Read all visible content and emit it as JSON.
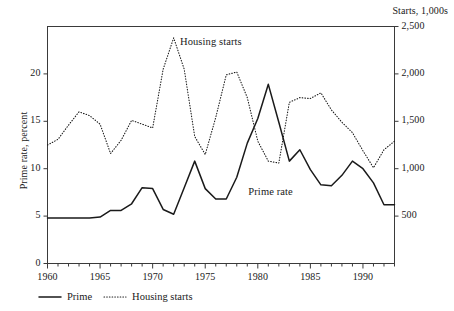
{
  "chart_data": {
    "type": "line",
    "title": "",
    "subtitle": "",
    "xlabel": "",
    "ylabel": "Prime rate, percent",
    "y2label": "Starts, 1,000s",
    "xlim": [
      1960,
      1993
    ],
    "ylim": [
      0,
      25
    ],
    "y2lim": [
      0,
      2500
    ],
    "grid": false,
    "legend_position": "below-axis-left",
    "x_tick_labels": [
      "1960",
      "1965",
      "1970",
      "1975",
      "1980",
      "1985",
      "1990"
    ],
    "x_tick_values": [
      1960,
      1965,
      1970,
      1975,
      1980,
      1985,
      1990
    ],
    "x_minor_tick_step": 1,
    "y_tick_labels": [
      "0",
      "5",
      "10",
      "15",
      "20"
    ],
    "y_tick_values": [
      0,
      5,
      10,
      15,
      20
    ],
    "y2_tick_labels": [
      "500",
      "1,000",
      "1,500",
      "2,000",
      "2,500"
    ],
    "y2_tick_values": [
      500,
      1000,
      1500,
      2000,
      2500
    ],
    "x": [
      1960,
      1961,
      1962,
      1963,
      1964,
      1965,
      1966,
      1967,
      1968,
      1969,
      1970,
      1971,
      1972,
      1973,
      1974,
      1975,
      1976,
      1977,
      1978,
      1979,
      1980,
      1981,
      1982,
      1983,
      1984,
      1985,
      1986,
      1987,
      1988,
      1989,
      1990,
      1991,
      1992,
      1993
    ],
    "series": [
      {
        "name": "Prime",
        "axis": "left",
        "style": "solid",
        "color": "#1a1a1a",
        "annotation": "Prime rate",
        "values": [
          4.8,
          4.8,
          4.8,
          4.8,
          4.8,
          4.9,
          5.6,
          5.6,
          6.3,
          8.0,
          7.9,
          5.7,
          5.2,
          8.0,
          10.8,
          7.9,
          6.8,
          6.8,
          9.1,
          12.7,
          15.3,
          18.9,
          14.9,
          10.8,
          12.0,
          9.9,
          8.3,
          8.2,
          9.3,
          10.8,
          10.0,
          8.5,
          6.2,
          6.2
        ]
      },
      {
        "name": "Housing starts",
        "axis": "right",
        "style": "dotted",
        "color": "#1a1a1a",
        "annotation": "Housing starts",
        "values": [
          1250,
          1310,
          1460,
          1600,
          1560,
          1470,
          1160,
          1300,
          1510,
          1470,
          1430,
          2050,
          2380,
          2050,
          1340,
          1150,
          1540,
          1990,
          2020,
          1750,
          1290,
          1080,
          1060,
          1700,
          1750,
          1740,
          1800,
          1620,
          1490,
          1380,
          1190,
          1010,
          1200,
          1290
        ]
      }
    ]
  },
  "axes": {
    "right_axis_title": "Starts, 1,000s",
    "left_axis_title": "Prime rate, percent"
  },
  "annotations": {
    "housing_starts": "Housing starts",
    "prime_rate": "Prime rate"
  },
  "legend": {
    "items": [
      {
        "label": "Prime",
        "style": "solid"
      },
      {
        "label": "Housing starts",
        "style": "dotted"
      }
    ]
  }
}
